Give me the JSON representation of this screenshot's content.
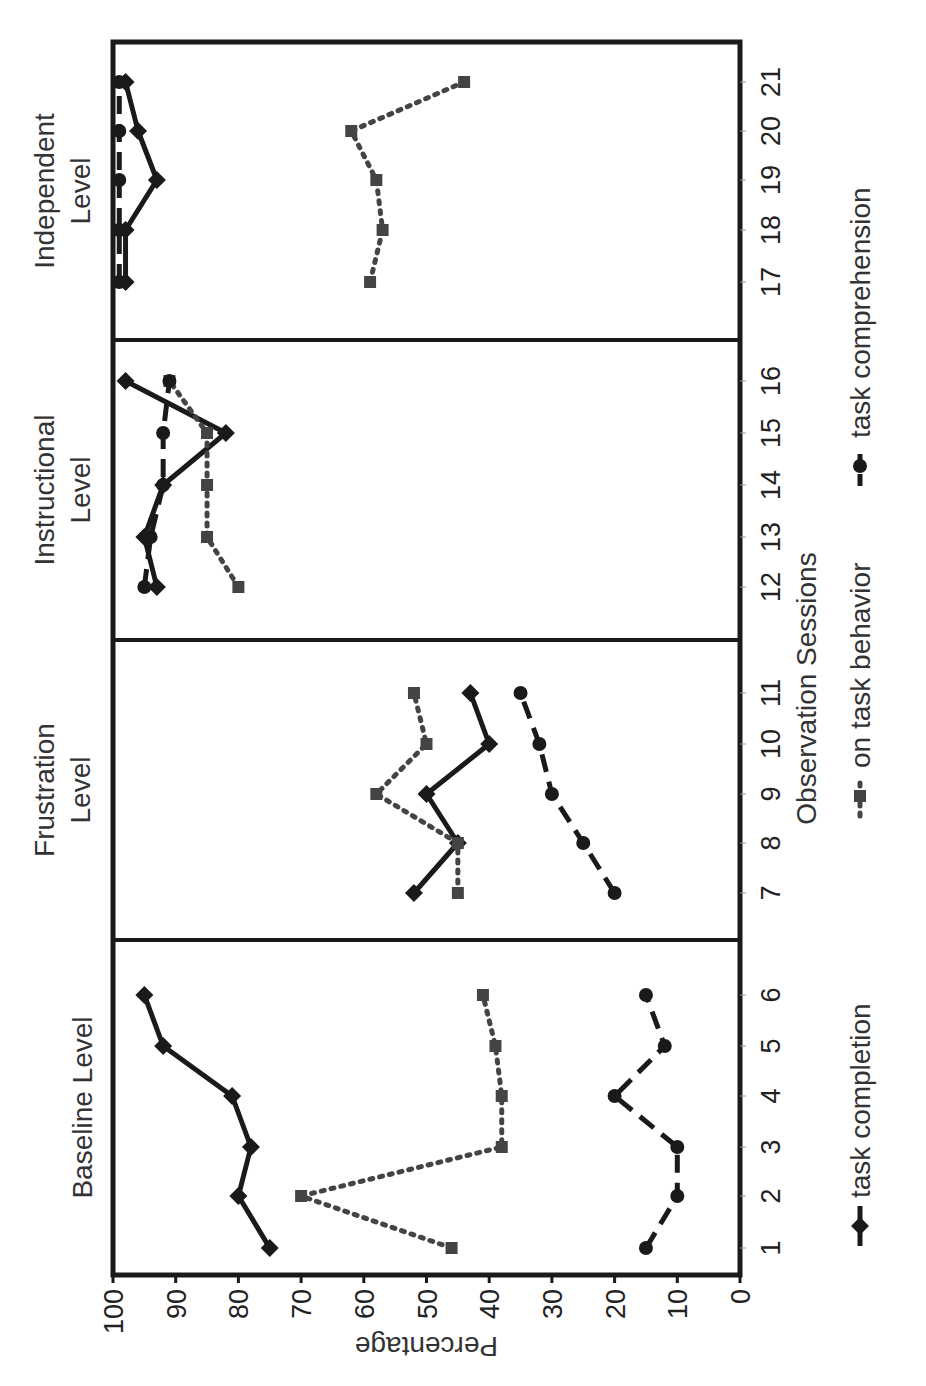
{
  "chart_data": {
    "type": "line",
    "orientation_note": "figure rotated 90 degrees counter-clockwise",
    "title": "",
    "xlabel": "Observation Sessions",
    "ylabel": "Percentage",
    "ylim": [
      0,
      100
    ],
    "yticks": [
      "0",
      "10",
      "20",
      "30",
      "40",
      "50",
      "60",
      "70",
      "80",
      "90",
      "100"
    ],
    "x": [
      1,
      2,
      3,
      4,
      5,
      6,
      7,
      8,
      9,
      10,
      11,
      12,
      13,
      14,
      15,
      16,
      17,
      18,
      19,
      20,
      21
    ],
    "grid": false,
    "legend_position": "bottom",
    "phases": [
      {
        "label_lines": [
          "Baseline Level"
        ],
        "sessions": [
          1,
          2,
          3,
          4,
          5,
          6
        ]
      },
      {
        "label_lines": [
          "Frustration",
          "Level"
        ],
        "sessions": [
          7,
          8,
          9,
          10,
          11
        ]
      },
      {
        "label_lines": [
          "Instructional",
          "Level"
        ],
        "sessions": [
          12,
          13,
          14,
          15,
          16
        ]
      },
      {
        "label_lines": [
          "Independent",
          "Level"
        ],
        "sessions": [
          17,
          18,
          19,
          20,
          21
        ]
      }
    ],
    "series": [
      {
        "name": "task completion",
        "style": "solid",
        "marker": "diamond",
        "values": [
          75,
          80,
          78,
          81,
          92,
          95,
          52,
          45,
          50,
          40,
          43,
          93,
          95,
          92,
          82,
          98,
          98,
          98,
          93,
          96,
          98
        ]
      },
      {
        "name": "on task behavior",
        "style": "dotted",
        "marker": "square",
        "values": [
          46,
          70,
          38,
          38,
          39,
          41,
          45,
          45,
          58,
          50,
          52,
          80,
          85,
          85,
          85,
          91,
          59,
          57,
          58,
          62,
          44
        ]
      },
      {
        "name": "task comprehension",
        "style": "dashed",
        "marker": "circle",
        "values": [
          15,
          10,
          10,
          20,
          12,
          15,
          20,
          25,
          30,
          32,
          35,
          95,
          94,
          92,
          92,
          91,
          99,
          99,
          99,
          99,
          99
        ]
      }
    ]
  },
  "colors": {
    "line": "#1a1a1a",
    "dotted": "#444444",
    "frame": "#1a1a1a",
    "text": "#333333"
  }
}
